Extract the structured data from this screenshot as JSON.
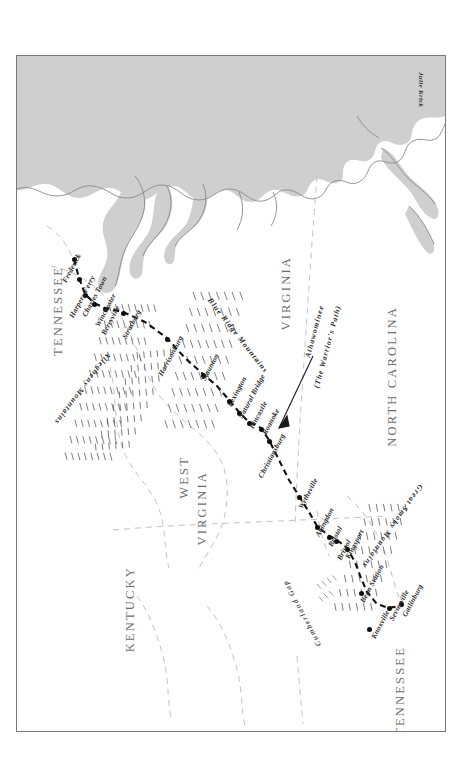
{
  "map": {
    "title": "Athawominee (The Warrior's Path) / Great Wagon Road",
    "credit": "Julie Krick",
    "colors": {
      "water": "#cfcfcf",
      "coastline": "#8a8a8a",
      "trail": "#111111",
      "state_border": "#bdbdbd",
      "label": "#6e6e6e",
      "mountain_hachure": "#4a4a4a"
    },
    "states": [
      {
        "name": "TENNESSEE",
        "x": 44,
        "y": 232
      },
      {
        "name": "VIRGINIA",
        "x": 258,
        "y": 232
      },
      {
        "name": "NORTH CAROLINA",
        "x": 360,
        "y": 232
      },
      {
        "name": "WEST VIRGINIA",
        "x": 170,
        "y": 440
      },
      {
        "name": "KENTUCKY",
        "x": 118,
        "y": 555
      },
      {
        "name": "TENNESSEE",
        "x": 380,
        "y": 625
      }
    ],
    "ranges": [
      {
        "name": "Allegheny Mountains",
        "x": 110,
        "y": 330
      },
      {
        "name": "Blue Ridge Mountains",
        "x": 230,
        "y": 282
      },
      {
        "name": "Great Smoky Mountains",
        "x": 405,
        "y": 470
      }
    ],
    "annotations": [
      {
        "name": "Athawominee",
        "x": 310,
        "y": 300
      },
      {
        "name": "(The Warrior's Path)",
        "x": 322,
        "y": 318
      },
      {
        "name": "Cumberland Gap",
        "x": 305,
        "y": 545
      }
    ],
    "cities": [
      {
        "name": "Frederick",
        "x": 57,
        "y": 215
      },
      {
        "name": "Harpers Ferry",
        "x": 68,
        "y": 226
      },
      {
        "name": "Charles Town",
        "x": 56,
        "y": 243
      },
      {
        "name": "Winchester",
        "x": 60,
        "y": 257
      },
      {
        "name": "Berryville",
        "x": 82,
        "y": 250
      },
      {
        "name": "Strasburg",
        "x": 110,
        "y": 248
      },
      {
        "name": "Harrisonburg",
        "x": 145,
        "y": 262
      },
      {
        "name": "Staunton",
        "x": 175,
        "y": 305
      },
      {
        "name": "Lexington",
        "x": 203,
        "y": 328
      },
      {
        "name": "Natural Bridge",
        "x": 215,
        "y": 345
      },
      {
        "name": "Fincastle",
        "x": 227,
        "y": 363
      },
      {
        "name": "Roanoke",
        "x": 236,
        "y": 378
      },
      {
        "name": "Christiansburg",
        "x": 253,
        "y": 355
      },
      {
        "name": "Wytheville",
        "x": 285,
        "y": 430
      },
      {
        "name": "Abingdon",
        "x": 300,
        "y": 472
      },
      {
        "name": "Bristol",
        "x": 312,
        "y": 480
      },
      {
        "name": "Kingsport",
        "x": 322,
        "y": 500
      },
      {
        "name": "Bean Station",
        "x": 340,
        "y": 540
      },
      {
        "name": "Knoxville",
        "x": 337,
        "y": 583
      },
      {
        "name": "Sevierville",
        "x": 360,
        "y": 570
      },
      {
        "name": "Gatlinburg",
        "x": 378,
        "y": 566
      }
    ],
    "compass": {
      "north": "N",
      "east": "E",
      "south": "S",
      "west": "W",
      "x": 295,
      "y": 705
    }
  }
}
